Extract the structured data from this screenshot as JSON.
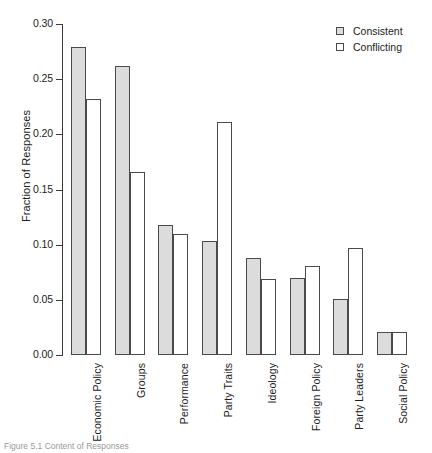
{
  "chart_data": {
    "type": "bar",
    "title": "",
    "xlabel": "",
    "ylabel": "Fraction of Responses",
    "ylim": [
      0.0,
      0.3
    ],
    "yticks": [
      "0.00",
      "0.05",
      "0.10",
      "0.15",
      "0.20",
      "0.25",
      "0.30"
    ],
    "ytick_values": [
      0.0,
      0.05,
      0.1,
      0.15,
      0.2,
      0.25,
      0.3
    ],
    "grid": false,
    "legend_position": "top-right",
    "categories": [
      "Economic Policy",
      "Groups",
      "Performance",
      "Party Traits",
      "Ideology",
      "Foreign Policy",
      "Party Leaders",
      "Social Policy"
    ],
    "series": [
      {
        "name": "Consistent",
        "color": "#dcdcdc",
        "values": [
          0.279,
          0.262,
          0.118,
          0.103,
          0.088,
          0.07,
          0.051,
          0.021
        ]
      },
      {
        "name": "Conflicting",
        "color": "#ffffff",
        "values": [
          0.232,
          0.166,
          0.11,
          0.211,
          0.069,
          0.081,
          0.097,
          0.021
        ]
      }
    ]
  },
  "legend": {
    "entries": [
      {
        "label": "Consistent",
        "swatch": "filled-gray-square"
      },
      {
        "label": "Conflicting",
        "swatch": "empty-white-square"
      }
    ]
  },
  "caption": {
    "text": "Figure 5.1  Content of Responses"
  }
}
